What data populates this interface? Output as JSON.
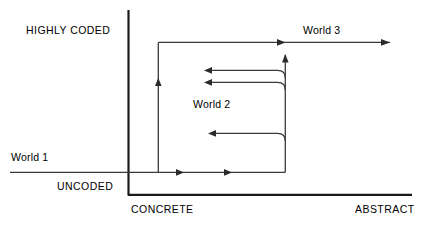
{
  "diagram": {
    "type": "scg-culture-space",
    "axes": {
      "vertical": {
        "top_label": "HIGHLY CODED",
        "bottom_label": "UNCODED"
      },
      "horizontal": {
        "left_label": "CONCRETE",
        "right_label": "ABSTRACT"
      }
    },
    "regions": [
      {
        "id": "world-1",
        "label": "World 1"
      },
      {
        "id": "world-2",
        "label": "World 2"
      },
      {
        "id": "world-3",
        "label": "World 3"
      }
    ],
    "colors": {
      "background": "#ffffff",
      "axis": "#1a1a1a",
      "flow": "#3a3a3a",
      "arrow": "#2b2b2b",
      "text": "#000000"
    }
  }
}
